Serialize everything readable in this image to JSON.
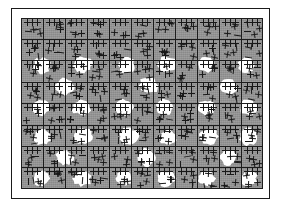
{
  "figure": {
    "width": 281,
    "height": 211,
    "background_color": "#ffffff"
  },
  "frame": {
    "name": "outer rule border",
    "border_color": "#1a1a1a",
    "border_width": 1.5,
    "fill_color": "#ffffff",
    "left": 11,
    "top": 8,
    "width": 259,
    "height": 191
  },
  "plate": {
    "name": "grey textured plate",
    "fill_color": "#9e9e9e",
    "left": 21,
    "top": 18,
    "width": 242,
    "height": 171
  },
  "grid": {
    "line_color": "#1c1c1c",
    "line_width": 1,
    "columns": 11,
    "rows": 8,
    "cell_width": 22,
    "cell_height": 21.4,
    "x_positions": [
      0,
      22,
      44,
      66,
      88,
      110,
      132,
      154,
      176,
      198,
      220,
      242
    ],
    "y_positions": [
      0,
      21.4,
      42.8,
      64.2,
      85.6,
      107,
      128.4,
      149.8,
      171
    ]
  },
  "texture": {
    "glyph": "barbed-cross-tick",
    "glyph_color": "#181818",
    "glyph_size": 7,
    "per_cell_count": 4,
    "description": "small plus/cross barb marks tiled across every grid cell"
  },
  "blobs": {
    "fill_color": "#ffffff",
    "count": 38,
    "description": "irregular white cloud-like patches, roughly one per occupied cell",
    "items": [
      {
        "cx": 21,
        "cy": 48,
        "rx": 10,
        "ry": 9
      },
      {
        "cx": 62,
        "cy": 47,
        "rx": 11,
        "ry": 9
      },
      {
        "cx": 106,
        "cy": 48,
        "rx": 10,
        "ry": 9
      },
      {
        "cx": 146,
        "cy": 47,
        "rx": 11,
        "ry": 9
      },
      {
        "cx": 186,
        "cy": 47,
        "rx": 10,
        "ry": 9
      },
      {
        "cx": 226,
        "cy": 48,
        "rx": 10,
        "ry": 9
      },
      {
        "cx": 44,
        "cy": 69,
        "rx": 11,
        "ry": 10
      },
      {
        "cx": 128,
        "cy": 68,
        "rx": 11,
        "ry": 10
      },
      {
        "cx": 208,
        "cy": 69,
        "rx": 10,
        "ry": 9
      },
      {
        "cx": 20,
        "cy": 90,
        "rx": 10,
        "ry": 9
      },
      {
        "cx": 61,
        "cy": 90,
        "rx": 11,
        "ry": 9
      },
      {
        "cx": 104,
        "cy": 90,
        "rx": 10,
        "ry": 9
      },
      {
        "cx": 144,
        "cy": 90,
        "rx": 10,
        "ry": 9
      },
      {
        "cx": 186,
        "cy": 90,
        "rx": 10,
        "ry": 9
      },
      {
        "cx": 228,
        "cy": 90,
        "rx": 10,
        "ry": 9
      },
      {
        "cx": 22,
        "cy": 120,
        "rx": 10,
        "ry": 9
      },
      {
        "cx": 63,
        "cy": 119,
        "rx": 11,
        "ry": 9
      },
      {
        "cx": 108,
        "cy": 119,
        "rx": 11,
        "ry": 10
      },
      {
        "cx": 148,
        "cy": 120,
        "rx": 10,
        "ry": 9
      },
      {
        "cx": 188,
        "cy": 119,
        "rx": 11,
        "ry": 9
      },
      {
        "cx": 228,
        "cy": 119,
        "rx": 11,
        "ry": 10
      },
      {
        "cx": 44,
        "cy": 140,
        "rx": 10,
        "ry": 9
      },
      {
        "cx": 126,
        "cy": 140,
        "rx": 11,
        "ry": 10
      },
      {
        "cx": 208,
        "cy": 140,
        "rx": 10,
        "ry": 9
      },
      {
        "cx": 21,
        "cy": 161,
        "rx": 10,
        "ry": 9
      },
      {
        "cx": 62,
        "cy": 161,
        "rx": 11,
        "ry": 9
      },
      {
        "cx": 104,
        "cy": 161,
        "rx": 10,
        "ry": 9
      },
      {
        "cx": 146,
        "cy": 161,
        "rx": 11,
        "ry": 9
      },
      {
        "cx": 186,
        "cy": 161,
        "rx": 10,
        "ry": 9
      },
      {
        "cx": 228,
        "cy": 161,
        "rx": 10,
        "ry": 9
      }
    ]
  }
}
